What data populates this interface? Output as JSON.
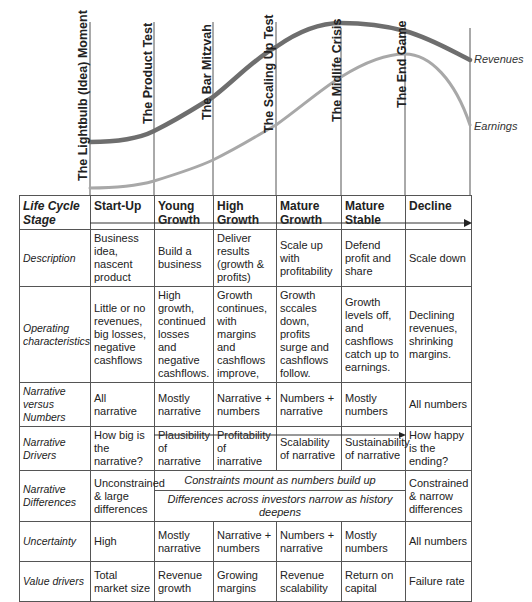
{
  "milestones": [
    {
      "label": "The Lightbulb (Idea) Moment"
    },
    {
      "label": "The Product Test"
    },
    {
      "label": "The Bar Mitzvah"
    },
    {
      "label": "The Scaling Up Test"
    },
    {
      "label": "The Midlife Crisis"
    },
    {
      "label": "The End Game"
    }
  ],
  "curves": {
    "revenues_label": "Revenues",
    "earnings_label": "Earnings",
    "revenues_color": "#6e6e6e",
    "earnings_color": "#a8a8a8"
  },
  "table": {
    "header": {
      "row_label": "Life Cycle Stage",
      "stages": [
        "Start-Up",
        "Young Growth",
        "High Growth",
        "Mature Growth",
        "Mature Stable",
        "Decline"
      ]
    },
    "rows": [
      {
        "label": "Description",
        "cells": [
          "Business idea, nascent product",
          "Build a business",
          "Deliver results (growth & profits)",
          "Scale up with profitability",
          "Defend profit and share",
          "Scale down"
        ]
      },
      {
        "label": "Operating characteristics",
        "cells": [
          "Little or no revenues, big losses, negative cashflows",
          "High growth, continued losses and negative cashflows.",
          "Growth continues, with margins and cashflows improve,",
          "Growth sccales down, profits surge and cashflows follow.",
          "Growth levels off, and cashflows catch up to earnings.",
          "Declining revenues, shrinking margins."
        ]
      },
      {
        "label": "Narrative versus Numbers",
        "cells": [
          "All narrative",
          "Mostly narrative",
          "Narrative + numbers",
          "Numbers + narrative",
          "Mostly numbers",
          "All numbers"
        ]
      },
      {
        "label": "Narrative Drivers",
        "cells": [
          "How big is the narrative?",
          "Plausibility of narrative",
          "Profitability of inarrative",
          "Scalability of narrative",
          "Sustainability of narrative",
          "How happy is the ending?"
        ]
      },
      {
        "label": "Narrative Differences",
        "first": "Unconstrained & large differences",
        "span_top": "Constraints mount as numbers build up",
        "span_bottom": "Differences across investors narrow as history deepens",
        "last": "Constrained & narrow differences"
      },
      {
        "label": "Uncertainty",
        "cells": [
          "High",
          "Mostly narrative",
          "Narrative + numbers",
          "Numbers + narrative",
          "Mostly numbers",
          "All numbers"
        ]
      },
      {
        "label": "Value drivers",
        "cells": [
          "Total market size",
          "Revenue growth",
          "Growing margins",
          "Revenue scalability",
          "Return on capital",
          "Failure rate"
        ]
      }
    ]
  }
}
